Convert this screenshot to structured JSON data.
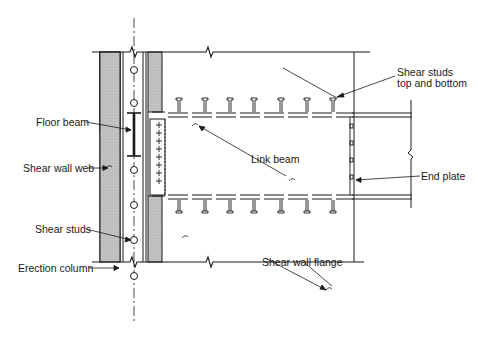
{
  "diagram": {
    "title": "",
    "labels": {
      "floor_beam": "Floor beam",
      "shear_wall_web": "Shear wall web",
      "shear_studs_left": "Shear studs",
      "erection_column": "Erection column",
      "link_beam": "Link beam",
      "shear_studs_top_line1": "Shear studs",
      "shear_studs_top_line2": "top and bottom",
      "end_plate": "End plate",
      "shear_wall_flange": "Shear wall flange"
    },
    "colors": {
      "line": "#1a1a1a",
      "hatch": "#bdbdbd",
      "background": "#ffffff"
    },
    "counts": {
      "top_studs": 7,
      "bottom_studs": 7,
      "column_studs": 8
    }
  }
}
